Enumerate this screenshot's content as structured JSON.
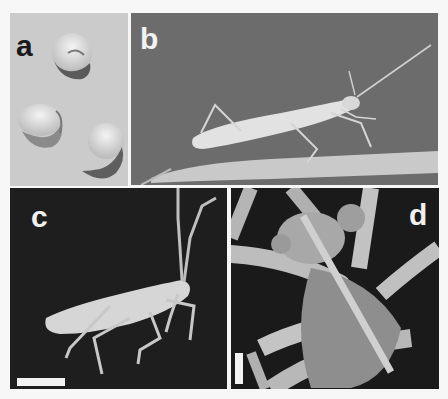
{
  "figure": {
    "panels": [
      {
        "id": "a",
        "label": "a",
        "description": "Three whitish insect eggs on light background",
        "background": "#cfcfcf",
        "label_color": "#1a1a1a"
      },
      {
        "id": "b",
        "label": "b",
        "description": "Pale elongated nymph with long antennae resting on a plant stem",
        "background": "#6e6e6e",
        "label_color": "#f2f2f2"
      },
      {
        "id": "c",
        "label": "c",
        "description": "Pale nymph on dark background, side view",
        "background": "#1f1f1f",
        "label_color": "#f0f0f0",
        "scale_bar": "horizontal"
      },
      {
        "id": "d",
        "label": "d",
        "description": "Scanning electron micrograph of head and mouthparts, ventral view",
        "background": "#181818",
        "label_color": "#f0f0f0",
        "scale_bar": "vertical"
      }
    ]
  }
}
